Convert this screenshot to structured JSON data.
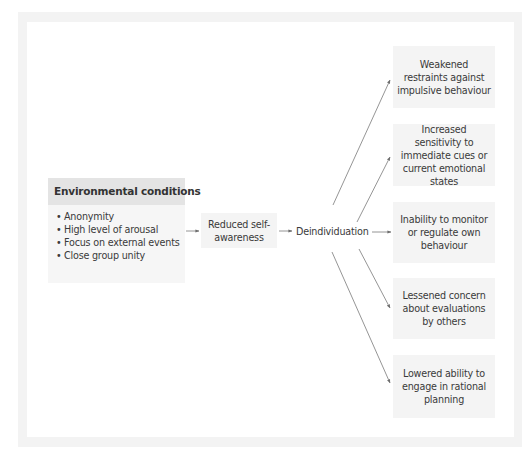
{
  "diagram": {
    "environmental_conditions": {
      "title": "Environmental conditions",
      "items": [
        "Anonymity",
        "High level of arousal",
        "Focus on external events",
        "Close group unity"
      ]
    },
    "intermediate": {
      "reduced_self_awareness": "Reduced self-awareness",
      "deindividuation": "Deindividuation"
    },
    "outcomes": [
      "Weakened restraints against impulsive behaviour",
      "Increased sensitivity to immediate cues or current emotional states",
      "Inability to monitor or regulate own behaviour",
      "Lessened concern about evaluations by others",
      "Lowered ability to engage in rational planning"
    ],
    "colors": {
      "header_fill": "#e4e4e4",
      "box_fill": "#f4f4f4",
      "frame": "#f3f3f3",
      "arrow": "#7a7a7a",
      "text": "#3a3a3a"
    }
  }
}
